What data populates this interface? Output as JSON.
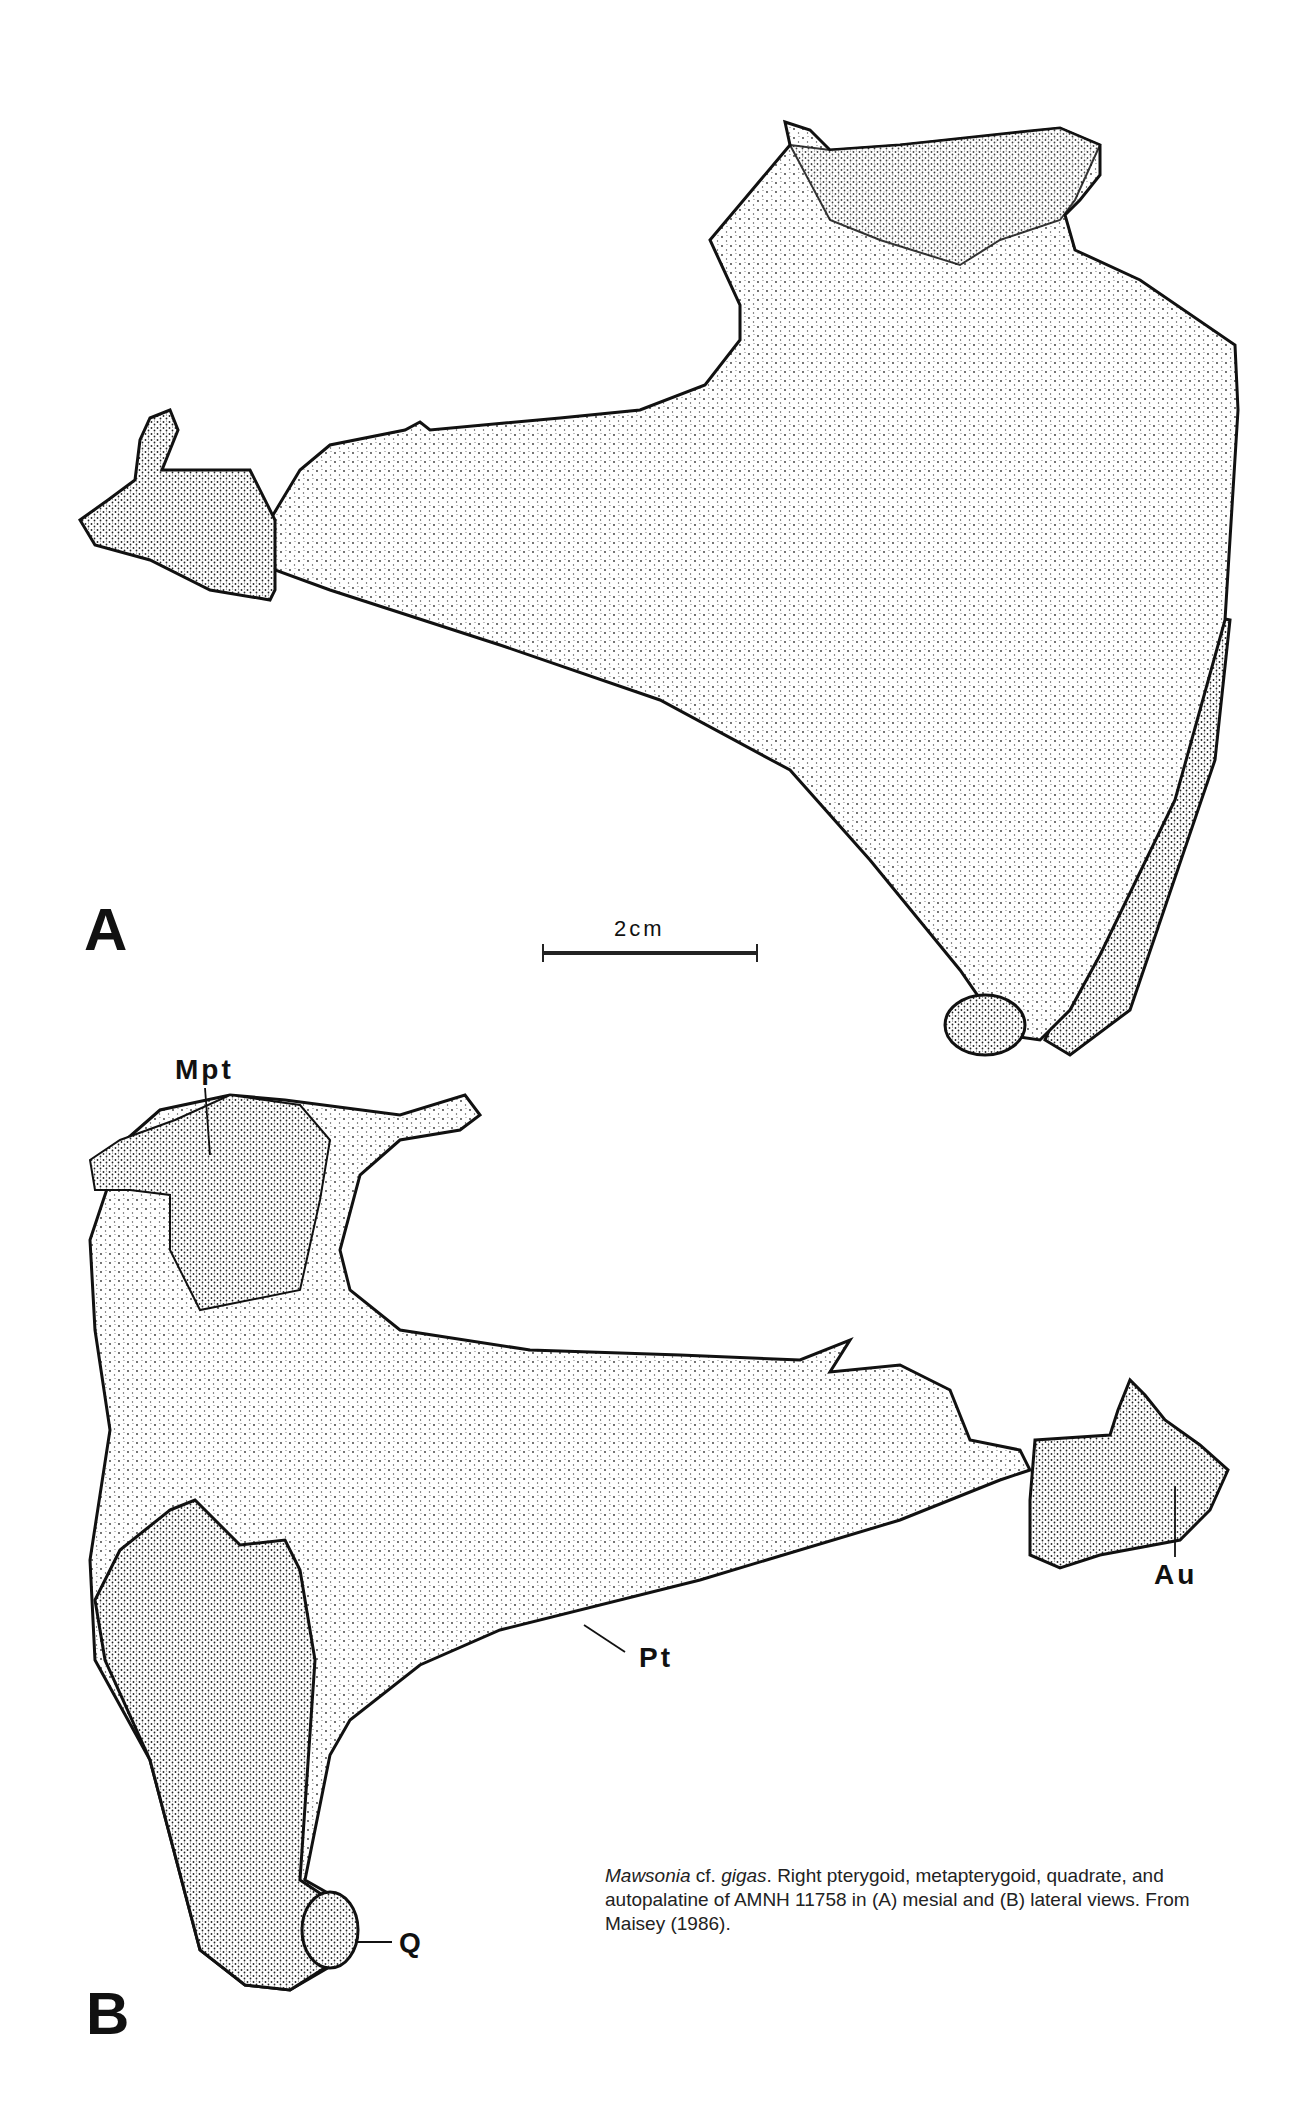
{
  "figure": {
    "panels": [
      {
        "label": "A",
        "view": "mesial"
      },
      {
        "label": "B",
        "view": "lateral"
      }
    ],
    "scale_bar": {
      "label": "2cm"
    },
    "anatomical_labels": {
      "mpt": "Mpt",
      "au": "Au",
      "pt": "Pt",
      "q": "Q"
    },
    "caption": {
      "genus": "Mawsonia",
      "cf": " cf. ",
      "species": "gigas",
      "text": ". Right pterygoid, metapterygoid, quadrate, and autopalatine of AMNH 11758 in (A) mesial and (B) lateral views. From Maisey (1986)."
    }
  }
}
